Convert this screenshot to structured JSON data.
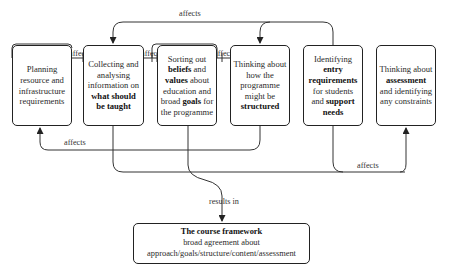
{
  "boxes": [
    {
      "id": "planning",
      "parts": [
        {
          "t": "Planning resource and infrastructure requirements",
          "b": false
        }
      ]
    },
    {
      "id": "collecting",
      "parts": [
        {
          "t": "Collecting and analysing information on ",
          "b": false
        },
        {
          "t": "what should be taught",
          "b": true
        }
      ]
    },
    {
      "id": "sorting",
      "parts": [
        {
          "t": "Sorting out ",
          "b": false
        },
        {
          "t": "beliefs",
          "b": true
        },
        {
          "t": " and ",
          "b": false
        },
        {
          "t": "values",
          "b": true
        },
        {
          "t": " about education and broad ",
          "b": false
        },
        {
          "t": "goals",
          "b": true
        },
        {
          "t": " for the programme",
          "b": false
        }
      ]
    },
    {
      "id": "structuring",
      "parts": [
        {
          "t": "Thinking about how the programme might be ",
          "b": false
        },
        {
          "t": "structured",
          "b": true
        }
      ]
    },
    {
      "id": "entry",
      "parts": [
        {
          "t": "Identifying ",
          "b": false
        },
        {
          "t": "entry requirements",
          "b": true
        },
        {
          "t": " for students and ",
          "b": false
        },
        {
          "t": "support needs",
          "b": true
        }
      ]
    },
    {
      "id": "assessment",
      "parts": [
        {
          "t": "Thinking about ",
          "b": false
        },
        {
          "t": "assessment",
          "b": true
        },
        {
          "t": " and identifying any constraints",
          "b": false
        }
      ]
    }
  ],
  "final_box": {
    "title": "The course framework",
    "line1": "broad agreement about",
    "line2": "approach/goals/structure/content/assessment"
  },
  "labels": {
    "top_affects": "affects",
    "affects_1": "affects",
    "affects_2": "affects",
    "affects_3": "affects",
    "bottom_left_affects": "affects",
    "bottom_right_affects": "affects",
    "results_in": "results in"
  },
  "edges": [
    {
      "from": "entry",
      "to": "collecting",
      "label": "affects"
    },
    {
      "from": "entry",
      "to": "structuring",
      "label": "affects"
    },
    {
      "from": "collecting",
      "to": "planning",
      "label": "affects"
    },
    {
      "from": "sorting",
      "to": "collecting",
      "label": "affects"
    },
    {
      "from": "sorting",
      "to": "structuring",
      "label": "affects"
    },
    {
      "from": "structuring",
      "to": "planning",
      "label": "affects"
    },
    {
      "from": "entry",
      "to": "assessment",
      "label": "affects"
    },
    {
      "from": "collecting",
      "to": "final",
      "label": "results in"
    },
    {
      "from": "sorting",
      "to": "final",
      "label": "results in"
    }
  ],
  "colors": {
    "line": "#333333",
    "border": "#222222",
    "text": "#2a2a2a"
  }
}
